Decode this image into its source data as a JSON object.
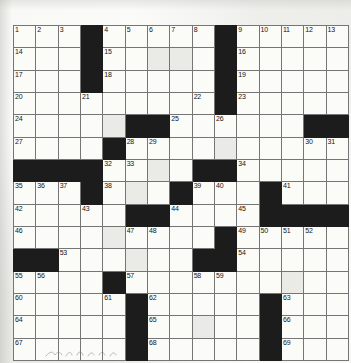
{
  "puzzle": {
    "title": "Crossword Grid",
    "rows": 15,
    "columns": 15,
    "colors": {
      "block": "#1c1c1c",
      "cell": "#fbfbf8",
      "grid_line": "#757575",
      "border": "#4a4a4a",
      "number_text": "#141414"
    },
    "numbers_total": 69,
    "grid": [
      [
        {
          "block": false,
          "number": "1"
        },
        {
          "block": false,
          "number": "2"
        },
        {
          "block": false,
          "number": "3"
        },
        {
          "block": true,
          "number": ""
        },
        {
          "block": false,
          "number": "4"
        },
        {
          "block": false,
          "number": "5"
        },
        {
          "block": false,
          "number": "6"
        },
        {
          "block": false,
          "number": "7"
        },
        {
          "block": false,
          "number": "8"
        },
        {
          "block": true,
          "number": ""
        },
        {
          "block": false,
          "number": "9"
        },
        {
          "block": false,
          "number": "10"
        },
        {
          "block": false,
          "number": "11"
        },
        {
          "block": false,
          "number": "12"
        },
        {
          "block": false,
          "number": "13"
        }
      ],
      [
        {
          "block": false,
          "number": "14"
        },
        {
          "block": false,
          "number": ""
        },
        {
          "block": false,
          "number": ""
        },
        {
          "block": true,
          "number": ""
        },
        {
          "block": false,
          "number": "15"
        },
        {
          "block": false,
          "number": ""
        },
        {
          "block": false,
          "number": ""
        },
        {
          "block": false,
          "number": ""
        },
        {
          "block": false,
          "number": ""
        },
        {
          "block": true,
          "number": ""
        },
        {
          "block": false,
          "number": "16"
        },
        {
          "block": false,
          "number": ""
        },
        {
          "block": false,
          "number": ""
        },
        {
          "block": false,
          "number": ""
        },
        {
          "block": false,
          "number": ""
        }
      ],
      [
        {
          "block": false,
          "number": "17"
        },
        {
          "block": false,
          "number": ""
        },
        {
          "block": false,
          "number": ""
        },
        {
          "block": true,
          "number": ""
        },
        {
          "block": false,
          "number": "18"
        },
        {
          "block": false,
          "number": ""
        },
        {
          "block": false,
          "number": ""
        },
        {
          "block": false,
          "number": ""
        },
        {
          "block": false,
          "number": ""
        },
        {
          "block": true,
          "number": ""
        },
        {
          "block": false,
          "number": "19"
        },
        {
          "block": false,
          "number": ""
        },
        {
          "block": false,
          "number": ""
        },
        {
          "block": false,
          "number": ""
        },
        {
          "block": false,
          "number": ""
        }
      ],
      [
        {
          "block": false,
          "number": "20"
        },
        {
          "block": false,
          "number": ""
        },
        {
          "block": false,
          "number": ""
        },
        {
          "block": false,
          "number": "21"
        },
        {
          "block": false,
          "number": ""
        },
        {
          "block": false,
          "number": ""
        },
        {
          "block": false,
          "number": ""
        },
        {
          "block": false,
          "number": ""
        },
        {
          "block": false,
          "number": "22"
        },
        {
          "block": true,
          "number": ""
        },
        {
          "block": false,
          "number": "23"
        },
        {
          "block": false,
          "number": ""
        },
        {
          "block": false,
          "number": ""
        },
        {
          "block": false,
          "number": ""
        },
        {
          "block": false,
          "number": ""
        }
      ],
      [
        {
          "block": false,
          "number": "24"
        },
        {
          "block": false,
          "number": ""
        },
        {
          "block": false,
          "number": ""
        },
        {
          "block": false,
          "number": ""
        },
        {
          "block": false,
          "number": ""
        },
        {
          "block": true,
          "number": ""
        },
        {
          "block": true,
          "number": ""
        },
        {
          "block": false,
          "number": "25"
        },
        {
          "block": false,
          "number": ""
        },
        {
          "block": false,
          "number": "26"
        },
        {
          "block": false,
          "number": ""
        },
        {
          "block": false,
          "number": ""
        },
        {
          "block": false,
          "number": ""
        },
        {
          "block": true,
          "number": ""
        },
        {
          "block": true,
          "number": ""
        }
      ],
      [
        {
          "block": false,
          "number": "27"
        },
        {
          "block": false,
          "number": ""
        },
        {
          "block": false,
          "number": ""
        },
        {
          "block": false,
          "number": ""
        },
        {
          "block": true,
          "number": ""
        },
        {
          "block": false,
          "number": "28"
        },
        {
          "block": false,
          "number": "29"
        },
        {
          "block": false,
          "number": ""
        },
        {
          "block": false,
          "number": ""
        },
        {
          "block": false,
          "number": ""
        },
        {
          "block": false,
          "number": ""
        },
        {
          "block": false,
          "number": ""
        },
        {
          "block": false,
          "number": ""
        },
        {
          "block": false,
          "number": "30"
        },
        {
          "block": false,
          "number": "31"
        }
      ],
      [
        {
          "block": true,
          "number": ""
        },
        {
          "block": true,
          "number": ""
        },
        {
          "block": true,
          "number": ""
        },
        {
          "block": true,
          "number": ""
        },
        {
          "block": false,
          "number": "32"
        },
        {
          "block": false,
          "number": "33"
        },
        {
          "block": false,
          "number": ""
        },
        {
          "block": false,
          "number": ""
        },
        {
          "block": true,
          "number": ""
        },
        {
          "block": true,
          "number": ""
        },
        {
          "block": false,
          "number": "34"
        },
        {
          "block": false,
          "number": ""
        },
        {
          "block": false,
          "number": ""
        },
        {
          "block": false,
          "number": ""
        },
        {
          "block": false,
          "number": ""
        }
      ],
      [
        {
          "block": false,
          "number": "35"
        },
        {
          "block": false,
          "number": "36"
        },
        {
          "block": false,
          "number": "37"
        },
        {
          "block": true,
          "number": ""
        },
        {
          "block": false,
          "number": "38"
        },
        {
          "block": false,
          "number": ""
        },
        {
          "block": false,
          "number": ""
        },
        {
          "block": true,
          "number": ""
        },
        {
          "block": false,
          "number": "39"
        },
        {
          "block": false,
          "number": "40"
        },
        {
          "block": false,
          "number": ""
        },
        {
          "block": true,
          "number": ""
        },
        {
          "block": false,
          "number": "41"
        },
        {
          "block": false,
          "number": ""
        },
        {
          "block": false,
          "number": ""
        }
      ],
      [
        {
          "block": false,
          "number": "42"
        },
        {
          "block": false,
          "number": ""
        },
        {
          "block": false,
          "number": ""
        },
        {
          "block": false,
          "number": "43"
        },
        {
          "block": false,
          "number": ""
        },
        {
          "block": true,
          "number": ""
        },
        {
          "block": true,
          "number": ""
        },
        {
          "block": false,
          "number": "44"
        },
        {
          "block": false,
          "number": ""
        },
        {
          "block": false,
          "number": ""
        },
        {
          "block": false,
          "number": "45"
        },
        {
          "block": true,
          "number": ""
        },
        {
          "block": true,
          "number": ""
        },
        {
          "block": true,
          "number": ""
        },
        {
          "block": true,
          "number": ""
        }
      ],
      [
        {
          "block": false,
          "number": "46"
        },
        {
          "block": false,
          "number": ""
        },
        {
          "block": false,
          "number": ""
        },
        {
          "block": false,
          "number": ""
        },
        {
          "block": false,
          "number": ""
        },
        {
          "block": false,
          "number": "47"
        },
        {
          "block": false,
          "number": "48"
        },
        {
          "block": false,
          "number": ""
        },
        {
          "block": false,
          "number": ""
        },
        {
          "block": true,
          "number": ""
        },
        {
          "block": false,
          "number": "49"
        },
        {
          "block": false,
          "number": "50"
        },
        {
          "block": false,
          "number": "51"
        },
        {
          "block": false,
          "number": "52"
        },
        {
          "block": false,
          "number": ""
        }
      ],
      [
        {
          "block": true,
          "number": ""
        },
        {
          "block": true,
          "number": ""
        },
        {
          "block": false,
          "number": "53"
        },
        {
          "block": false,
          "number": ""
        },
        {
          "block": false,
          "number": ""
        },
        {
          "block": false,
          "number": ""
        },
        {
          "block": false,
          "number": ""
        },
        {
          "block": false,
          "number": ""
        },
        {
          "block": true,
          "number": ""
        },
        {
          "block": true,
          "number": ""
        },
        {
          "block": false,
          "number": "54"
        },
        {
          "block": false,
          "number": ""
        },
        {
          "block": false,
          "number": ""
        },
        {
          "block": false,
          "number": ""
        },
        {
          "block": false,
          "number": ""
        }
      ],
      [
        {
          "block": false,
          "number": "55"
        },
        {
          "block": false,
          "number": "56"
        },
        {
          "block": false,
          "number": ""
        },
        {
          "block": false,
          "number": ""
        },
        {
          "block": true,
          "number": ""
        },
        {
          "block": false,
          "number": "57"
        },
        {
          "block": false,
          "number": ""
        },
        {
          "block": false,
          "number": ""
        },
        {
          "block": false,
          "number": "58"
        },
        {
          "block": false,
          "number": "59"
        },
        {
          "block": false,
          "number": ""
        },
        {
          "block": false,
          "number": ""
        },
        {
          "block": false,
          "number": ""
        },
        {
          "block": false,
          "number": ""
        },
        {
          "block": false,
          "number": ""
        }
      ],
      [
        {
          "block": false,
          "number": "60"
        },
        {
          "block": false,
          "number": ""
        },
        {
          "block": false,
          "number": ""
        },
        {
          "block": false,
          "number": ""
        },
        {
          "block": false,
          "number": "61"
        },
        {
          "block": true,
          "number": ""
        },
        {
          "block": false,
          "number": "62"
        },
        {
          "block": false,
          "number": ""
        },
        {
          "block": false,
          "number": ""
        },
        {
          "block": false,
          "number": ""
        },
        {
          "block": false,
          "number": ""
        },
        {
          "block": true,
          "number": ""
        },
        {
          "block": false,
          "number": "63"
        },
        {
          "block": false,
          "number": ""
        },
        {
          "block": false,
          "number": ""
        }
      ],
      [
        {
          "block": false,
          "number": "64"
        },
        {
          "block": false,
          "number": ""
        },
        {
          "block": false,
          "number": ""
        },
        {
          "block": false,
          "number": ""
        },
        {
          "block": false,
          "number": ""
        },
        {
          "block": true,
          "number": ""
        },
        {
          "block": false,
          "number": "65"
        },
        {
          "block": false,
          "number": ""
        },
        {
          "block": false,
          "number": ""
        },
        {
          "block": false,
          "number": ""
        },
        {
          "block": false,
          "number": ""
        },
        {
          "block": true,
          "number": ""
        },
        {
          "block": false,
          "number": "66"
        },
        {
          "block": false,
          "number": ""
        },
        {
          "block": false,
          "number": ""
        }
      ],
      [
        {
          "block": false,
          "number": "67"
        },
        {
          "block": false,
          "number": ""
        },
        {
          "block": false,
          "number": ""
        },
        {
          "block": false,
          "number": ""
        },
        {
          "block": false,
          "number": ""
        },
        {
          "block": true,
          "number": ""
        },
        {
          "block": false,
          "number": "68"
        },
        {
          "block": false,
          "number": ""
        },
        {
          "block": false,
          "number": ""
        },
        {
          "block": false,
          "number": ""
        },
        {
          "block": false,
          "number": ""
        },
        {
          "block": true,
          "number": ""
        },
        {
          "block": false,
          "number": "69"
        },
        {
          "block": false,
          "number": ""
        },
        {
          "block": false,
          "number": ""
        }
      ]
    ]
  }
}
